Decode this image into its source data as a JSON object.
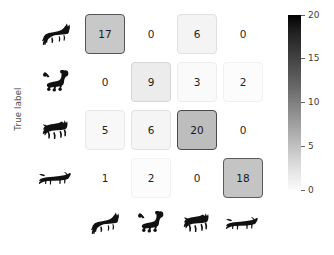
{
  "axes": {
    "ylabel": "True label"
  },
  "classes": [
    {
      "key": "german-shepherd",
      "icon": "german-shepherd-silhouette-icon"
    },
    {
      "key": "poodle",
      "icon": "poodle-silhouette-icon"
    },
    {
      "key": "pug",
      "icon": "pug-silhouette-icon"
    },
    {
      "key": "dachshund",
      "icon": "dachshund-silhouette-icon"
    }
  ],
  "colorbar": {
    "ticks": [
      "20",
      "15",
      "10",
      "5",
      "0"
    ],
    "min_color": "#ffffff",
    "max_color": "#000000"
  },
  "chart_data": {
    "type": "heatmap",
    "title": "",
    "xlabel": "",
    "ylabel": "True label",
    "categories": [
      "german shepherd",
      "poodle",
      "pug",
      "dachshund"
    ],
    "x_tick_labels": [
      "german shepherd",
      "poodle",
      "pug",
      "dachshund"
    ],
    "y_tick_labels": [
      "german shepherd",
      "poodle",
      "pug",
      "dachshund"
    ],
    "tick_label_style": "dog-silhouette-icons",
    "values": [
      [
        17,
        0,
        6,
        0
      ],
      [
        0,
        9,
        3,
        2
      ],
      [
        5,
        6,
        20,
        0
      ],
      [
        1,
        2,
        0,
        18
      ]
    ],
    "cells": [
      {
        "row": 0,
        "col": 0,
        "value": "17",
        "shade": "#c8c8c8",
        "border": "#555555",
        "boxed": true
      },
      {
        "row": 0,
        "col": 1,
        "value": "0",
        "shade": "transparent",
        "border": "transparent",
        "boxed": false
      },
      {
        "row": 0,
        "col": 2,
        "value": "6",
        "shade": "#f4f4f4",
        "border": "#e0e0e0",
        "boxed": true
      },
      {
        "row": 0,
        "col": 3,
        "value": "0",
        "shade": "transparent",
        "border": "transparent",
        "boxed": false
      },
      {
        "row": 1,
        "col": 0,
        "value": "0",
        "shade": "transparent",
        "border": "transparent",
        "boxed": false
      },
      {
        "row": 1,
        "col": 1,
        "value": "9",
        "shade": "#ececec",
        "border": "#d4d4d4",
        "boxed": true
      },
      {
        "row": 1,
        "col": 2,
        "value": "3",
        "shade": "#fafafa",
        "border": "#ededed",
        "boxed": true
      },
      {
        "row": 1,
        "col": 3,
        "value": "2",
        "shade": "#fcfcfc",
        "border": "#f1f1f1",
        "boxed": true
      },
      {
        "row": 2,
        "col": 0,
        "value": "5",
        "shade": "#f8f8f8",
        "border": "#e8e8e8",
        "boxed": true
      },
      {
        "row": 2,
        "col": 1,
        "value": "6",
        "shade": "#f5f5f5",
        "border": "#e2e2e2",
        "boxed": true
      },
      {
        "row": 2,
        "col": 2,
        "value": "20",
        "shade": "#bdbdbd",
        "border": "#4a4a4a",
        "boxed": true
      },
      {
        "row": 2,
        "col": 3,
        "value": "0",
        "shade": "transparent",
        "border": "transparent",
        "boxed": false
      },
      {
        "row": 3,
        "col": 0,
        "value": "1",
        "shade": "transparent",
        "border": "transparent",
        "boxed": false
      },
      {
        "row": 3,
        "col": 1,
        "value": "2",
        "shade": "#fcfcfc",
        "border": "#f2f2f2",
        "boxed": true
      },
      {
        "row": 3,
        "col": 2,
        "value": "0",
        "shade": "transparent",
        "border": "transparent",
        "boxed": false
      },
      {
        "row": 3,
        "col": 3,
        "value": "18",
        "shade": "#c4c4c4",
        "border": "#5a5a5a",
        "boxed": true
      }
    ],
    "colorbar": {
      "vmin": 0,
      "vmax": 20,
      "ticks": [
        0,
        5,
        10,
        15,
        20
      ],
      "colormap": "Greys",
      "position": "right"
    },
    "grid": false,
    "legend": "colorbar-right"
  }
}
